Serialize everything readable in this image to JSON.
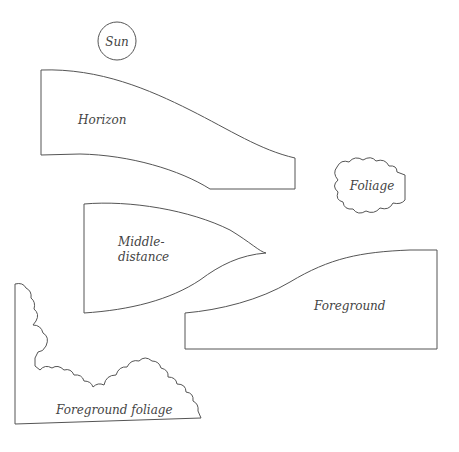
{
  "diagram": {
    "type": "landscape-layer-cutouts",
    "stroke_color": "#555555",
    "text_color": "#444444",
    "pieces": [
      {
        "id": "sun",
        "label": "Sun"
      },
      {
        "id": "horizon",
        "label": "Horizon"
      },
      {
        "id": "foliage",
        "label": "Foliage"
      },
      {
        "id": "middle-distance",
        "label_line1": "Middle-",
        "label_line2": "distance"
      },
      {
        "id": "foreground",
        "label": "Foreground"
      },
      {
        "id": "foreground-foliage",
        "label": "Foreground foliage"
      }
    ]
  }
}
